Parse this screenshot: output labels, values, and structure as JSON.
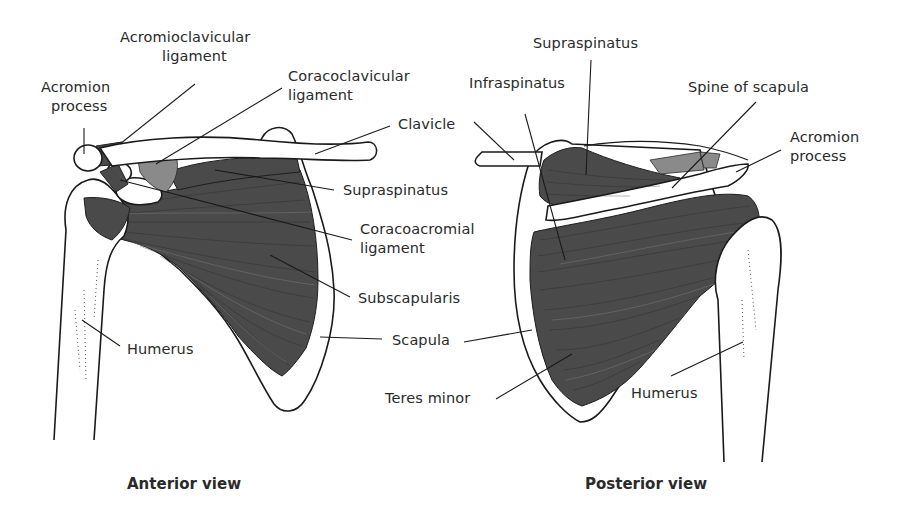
{
  "diagram": {
    "views": [
      {
        "id": "anterior",
        "caption": "Anterior view",
        "labels": [
          {
            "key": "acromioclavicular_ligament",
            "lines": [
              "Acromioclavicular",
              "ligament"
            ]
          },
          {
            "key": "acromion_process",
            "lines": [
              "Acromion",
              "process"
            ]
          },
          {
            "key": "coracoclavicular_ligament",
            "lines": [
              "Coracoclavicular",
              "ligament"
            ]
          },
          {
            "key": "clavicle",
            "lines": [
              "Clavicle"
            ]
          },
          {
            "key": "supraspinatus",
            "lines": [
              "Supraspinatus"
            ]
          },
          {
            "key": "coracoacromial_ligament",
            "lines": [
              "Coracoacromial",
              "ligament"
            ]
          },
          {
            "key": "subscapularis",
            "lines": [
              "Subscapularis"
            ]
          },
          {
            "key": "scapula",
            "lines": [
              "Scapula"
            ]
          },
          {
            "key": "humerus",
            "lines": [
              "Humerus"
            ]
          }
        ]
      },
      {
        "id": "posterior",
        "caption": "Posterior view",
        "labels": [
          {
            "key": "supraspinatus",
            "lines": [
              "Supraspinatus"
            ]
          },
          {
            "key": "infraspinatus",
            "lines": [
              "Infraspinatus"
            ]
          },
          {
            "key": "spine_of_scapula",
            "lines": [
              "Spine of scapula"
            ]
          },
          {
            "key": "acromion_process",
            "lines": [
              "Acromion",
              "process"
            ]
          },
          {
            "key": "teres_minor",
            "lines": [
              "Teres minor"
            ]
          },
          {
            "key": "humerus",
            "lines": [
              "Humerus"
            ]
          }
        ]
      }
    ]
  },
  "text": {
    "acromioclavicular_1": "Acromioclavicular",
    "acromioclavicular_2": "ligament",
    "acromion_a_1": "Acromion",
    "acromion_a_2": "process",
    "coracoclavicular_1": "Coracoclavicular",
    "coracoclavicular_2": "ligament",
    "clavicle": "Clavicle",
    "supraspinatus_a": "Supraspinatus",
    "coracoacromial_1": "Coracoacromial",
    "coracoacromial_2": "ligament",
    "subscapularis": "Subscapularis",
    "scapula": "Scapula",
    "humerus_a": "Humerus",
    "supraspinatus_p": "Supraspinatus",
    "infraspinatus": "Infraspinatus",
    "spine_of_scapula": "Spine of scapula",
    "acromion_p_1": "Acromion",
    "acromion_p_2": "process",
    "teres_minor": "Teres minor",
    "humerus_p": "Humerus",
    "caption_anterior": "Anterior view",
    "caption_posterior": "Posterior view"
  },
  "colors": {
    "background": "#ffffff",
    "ink": "#1a1a1a",
    "muscle": "#4a4a4a",
    "ligament": "#8a8a8a"
  }
}
